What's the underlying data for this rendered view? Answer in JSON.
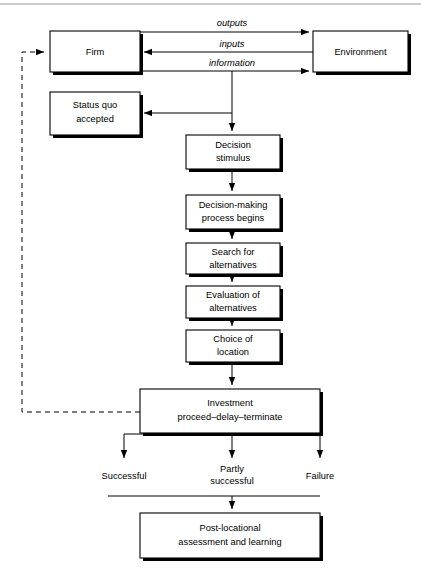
{
  "figure": {
    "type": "flowchart",
    "top_rule": true
  },
  "boxes": {
    "firm": {
      "label": "Firm",
      "x": 50,
      "y": 31,
      "w": 90,
      "h": 41
    },
    "environment": {
      "label": "Environment",
      "x": 313,
      "y": 31,
      "w": 95,
      "h": 41
    },
    "status_quo": {
      "line1": "Status quo",
      "line2": "accepted",
      "x": 50,
      "y": 92,
      "w": 90,
      "h": 43
    },
    "decision_stimulus": {
      "line1": "Decision",
      "line2": "stimulus",
      "x": 186,
      "y": 135,
      "w": 94,
      "h": 34
    },
    "decision_making": {
      "line1": "Decision-making",
      "line2": "process begins",
      "x": 186,
      "y": 195,
      "w": 94,
      "h": 34
    },
    "search": {
      "line1": "Search for",
      "line2": "alternatives",
      "x": 186,
      "y": 243,
      "w": 94,
      "h": 31
    },
    "evaluation": {
      "line1": "Evaluation of",
      "line2": "alternatives",
      "x": 186,
      "y": 286,
      "w": 94,
      "h": 32
    },
    "choice": {
      "line1": "Choice of",
      "line2": "location",
      "x": 186,
      "y": 330,
      "w": 94,
      "h": 32
    },
    "investment": {
      "line1": "Investment",
      "line2": "proceed–delay–terminate",
      "x": 140,
      "y": 389,
      "w": 180,
      "h": 44
    },
    "post_locational": {
      "line1": "Post-locational",
      "line2": "assessment and learning",
      "x": 140,
      "y": 513,
      "w": 180,
      "h": 45
    }
  },
  "flow_labels": {
    "outputs": "outputs",
    "inputs": "inputs",
    "information": "information"
  },
  "outcomes": [
    {
      "key": "successful",
      "line1": "Successful",
      "line2": "",
      "x": 124
    },
    {
      "key": "partly_successful",
      "line1": "Partly",
      "line2": "successful",
      "x": 232
    },
    {
      "key": "failure",
      "line1": "Failure",
      "line2": "",
      "x": 320
    }
  ],
  "colors": {
    "line": "#000000",
    "box_fill": "#ffffff",
    "rule": "#9a9a9a",
    "text": "#000000"
  }
}
